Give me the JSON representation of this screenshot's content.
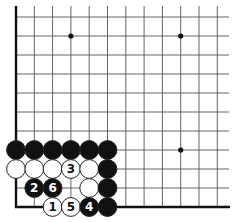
{
  "diagram": {
    "type": "go-board-problem",
    "visible_region": "lower-left corner",
    "grid": {
      "columns": 12,
      "rows": 11,
      "origin_x": 16,
      "origin_y": 17,
      "spacing_x": 18.3,
      "spacing_y": 19,
      "line_color": "#555555",
      "edge_color": "#111111",
      "left_edge": true,
      "bottom_edge": true
    },
    "star_points": [
      {
        "col": 3,
        "row": 1
      },
      {
        "col": 9,
        "row": 1
      },
      {
        "col": 9,
        "row": 7
      }
    ],
    "stones": [
      {
        "color": "black",
        "col": 0,
        "row": 7,
        "label": ""
      },
      {
        "color": "black",
        "col": 1,
        "row": 7,
        "label": ""
      },
      {
        "color": "black",
        "col": 2,
        "row": 7,
        "label": ""
      },
      {
        "color": "black",
        "col": 3,
        "row": 7,
        "label": ""
      },
      {
        "color": "black",
        "col": 4,
        "row": 7,
        "label": ""
      },
      {
        "color": "black",
        "col": 5,
        "row": 7,
        "label": ""
      },
      {
        "color": "white",
        "col": 0,
        "row": 8,
        "label": ""
      },
      {
        "color": "white",
        "col": 1,
        "row": 8,
        "label": ""
      },
      {
        "color": "white",
        "col": 2,
        "row": 8,
        "label": ""
      },
      {
        "color": "white",
        "col": 3,
        "row": 8,
        "label": "3"
      },
      {
        "color": "white",
        "col": 4,
        "row": 8,
        "label": ""
      },
      {
        "color": "black",
        "col": 5,
        "row": 8,
        "label": ""
      },
      {
        "color": "black",
        "col": 1,
        "row": 9,
        "label": "2"
      },
      {
        "color": "black",
        "col": 2,
        "row": 9,
        "label": "6"
      },
      {
        "color": "white",
        "col": 4,
        "row": 9,
        "label": ""
      },
      {
        "color": "black",
        "col": 5,
        "row": 9,
        "label": ""
      },
      {
        "color": "white",
        "col": 2,
        "row": 10,
        "label": "1"
      },
      {
        "color": "white",
        "col": 3,
        "row": 10,
        "label": "5"
      },
      {
        "color": "black",
        "col": 4,
        "row": 10,
        "label": "4"
      },
      {
        "color": "black",
        "col": 5,
        "row": 10,
        "label": ""
      }
    ],
    "colors": {
      "black_stone": "#111111",
      "white_stone": "#ffffff",
      "stone_outline": "#222222"
    }
  }
}
